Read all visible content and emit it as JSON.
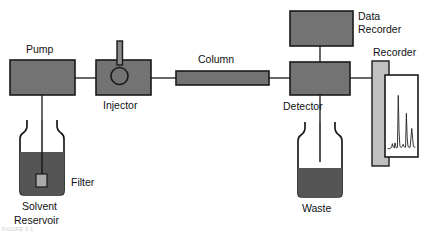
{
  "diagram": {
    "type": "flow-diagram",
    "background_color": "#ffffff",
    "stroke_color": "#1a1a1a",
    "colors": {
      "component_fill": "#737373",
      "recorder_body_fill": "#c0c0c0",
      "liquid_fill": "#555555",
      "filter_fill": "#aaaaaa",
      "chart_paper_fill": "#ffffff",
      "trace_color": "#222222"
    },
    "labels": {
      "pump": "Pump",
      "injector": "Injector",
      "column": "Column",
      "detector": "Detector",
      "data_recorder_line1": "Data",
      "data_recorder_line2": "Recorder",
      "recorder": "Recorder",
      "filter": "Filter",
      "solvent_reservoir_line1": "Solvent",
      "solvent_reservoir_line2": "Reservoir",
      "waste": "Waste"
    },
    "caption_fragment": "FIGURE 3-1"
  },
  "chart_data": {
    "type": "line",
    "xlabel": "Retention time",
    "ylabel": "Detector response",
    "grid": false,
    "legend": null,
    "xlim": [
      0,
      100
    ],
    "ylim": [
      0,
      100
    ],
    "series": [
      {
        "name": "Chromatogram",
        "x": [
          0,
          6,
          11,
          14,
          16,
          18,
          20,
          23,
          26,
          29,
          31,
          33,
          35,
          38,
          41,
          44,
          47,
          50,
          53,
          56,
          59,
          62,
          65,
          68,
          71,
          74,
          78,
          82,
          88,
          94,
          100
        ],
        "y": [
          6,
          6,
          7,
          9,
          13,
          10,
          8,
          7,
          14,
          9,
          7,
          7,
          8,
          80,
          30,
          10,
          8,
          8,
          9,
          12,
          9,
          8,
          8,
          55,
          22,
          9,
          8,
          8,
          34,
          9,
          8
        ]
      }
    ],
    "peaks": [
      {
        "label": "peak-1",
        "x": 38,
        "height": 80
      },
      {
        "label": "peak-2",
        "x": 68,
        "height": 55
      },
      {
        "label": "peak-3",
        "x": 88,
        "height": 34
      }
    ]
  }
}
